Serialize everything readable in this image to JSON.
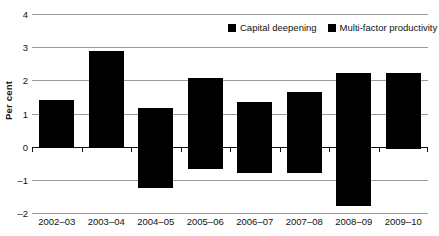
{
  "chart_data": {
    "type": "bar",
    "title": "",
    "subtitle": "",
    "xlabel": "",
    "ylabel": "Per cent",
    "ylim": [
      -2,
      4
    ],
    "yticks": [
      4,
      3,
      2,
      1,
      0,
      -1,
      -2
    ],
    "ytick_labels": [
      "4",
      "3",
      "2",
      "1",
      "0",
      "–1",
      "–2"
    ],
    "grid": true,
    "stacked": true,
    "legend_position": "top-right",
    "categories": [
      "2002–03",
      "2003–04",
      "2004–05",
      "2005–06",
      "2006–07",
      "2007–08",
      "2008–09",
      "2009–10"
    ],
    "series": [
      {
        "name": "Capital deepening",
        "color": "#000000",
        "values": [
          1.4,
          2.88,
          1.17,
          2.07,
          1.36,
          1.64,
          2.23,
          2.22
        ]
      },
      {
        "name": "Multi-factor productivity",
        "color": "#000000",
        "values": [
          -0.02,
          -0.03,
          -1.25,
          -0.67,
          -0.78,
          -0.78,
          -1.78,
          -0.08
        ]
      }
    ]
  },
  "legend": {
    "items": [
      {
        "label": "Capital deepening",
        "color": "#000000",
        "swatch": "square-swatch"
      },
      {
        "label": "Multi-factor productivity",
        "color": "#000000",
        "swatch": "square-swatch"
      }
    ]
  }
}
